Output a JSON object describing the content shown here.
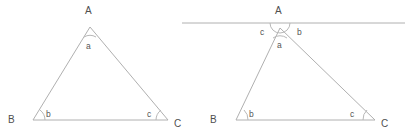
{
  "figure": {
    "line_color": "#b0b0b0",
    "text_color": "#555555",
    "background": "#ffffff"
  },
  "left_figure": {
    "name": "triangle-abc",
    "vertices": [
      {
        "key": "A",
        "label": "A",
        "x": 88,
        "y": 12
      },
      {
        "key": "B",
        "label": "B",
        "x": 11,
        "y": 121
      },
      {
        "key": "C",
        "label": "C",
        "x": 177,
        "y": 125
      }
    ],
    "angle_labels": [
      {
        "key": "a",
        "label": "a",
        "x": 86,
        "y": 41
      },
      {
        "key": "b",
        "label": "b",
        "x": 44,
        "y": 112
      },
      {
        "key": "c",
        "label": "c",
        "x": 152,
        "y": 112
      }
    ]
  },
  "right_figure": {
    "name": "triangle-abc-with-parallel-line",
    "vertices": [
      {
        "key": "A",
        "label": "A",
        "x": 277,
        "y": 12
      },
      {
        "key": "B",
        "label": "B",
        "x": 213,
        "y": 121
      },
      {
        "key": "C",
        "label": "C",
        "x": 381,
        "y": 125
      }
    ],
    "angle_labels": [
      {
        "key": "a",
        "label": "a",
        "x": 278,
        "y": 41
      },
      {
        "key": "b_interior",
        "label": "b",
        "x": 233,
        "y": 112
      },
      {
        "key": "c_interior",
        "label": "c",
        "x": 355,
        "y": 112
      },
      {
        "key": "c_alternate",
        "label": "c",
        "x": 260,
        "y": 30
      },
      {
        "key": "b_alternate",
        "label": "b",
        "x": 297,
        "y": 30
      }
    ],
    "parallel_line": {
      "label": "parallel line through A",
      "x1": 182,
      "x2": 405,
      "y": 23
    }
  }
}
